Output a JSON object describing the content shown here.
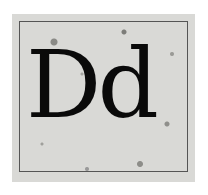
{
  "tile": {
    "upper": "D",
    "lower": "d"
  }
}
